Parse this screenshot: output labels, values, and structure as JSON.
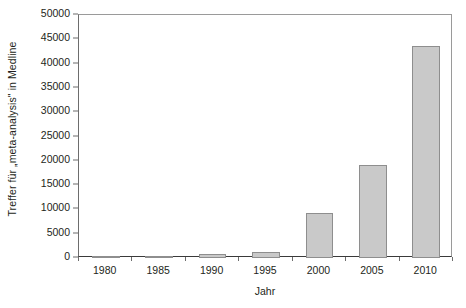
{
  "chart_data": {
    "type": "bar",
    "title": "",
    "xlabel": "Jahr",
    "ylabel": "Treffer für „meta-analysis\" in Medline",
    "categories": [
      "1980",
      "1985",
      "1990",
      "1995",
      "2000",
      "2005",
      "2010"
    ],
    "values": [
      150,
      300,
      750,
      1250,
      9200,
      19100,
      43600
    ],
    "ylim": [
      0,
      50000
    ],
    "yticks": [
      0,
      5000,
      10000,
      15000,
      20000,
      25000,
      30000,
      35000,
      40000,
      45000,
      50000
    ],
    "ytick_labels": [
      "0",
      "5000",
      "10000",
      "15000",
      "20000",
      "25000",
      "30000",
      "35000",
      "40000",
      "45000",
      "50000"
    ],
    "grid": false,
    "legend": "none",
    "bar_fill_color": "#c9c9c9",
    "bar_border_color": "#8e8e8e",
    "axis_color": "#3a3a3a",
    "text_color": "#231f20"
  }
}
